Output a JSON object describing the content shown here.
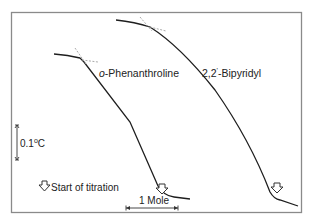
{
  "figure": {
    "type": "thermometric-titration-curves",
    "colors": {
      "frame": "#7a7a7a",
      "curve": "#1e1e1e",
      "tangent": "#9a9a9a",
      "text": "#222222",
      "background": "#ffffff"
    }
  },
  "curves": [
    {
      "name": "o-Phenanthroline",
      "label": "o-Phenanthroline",
      "label_prefix": "o",
      "label_suffix": "-Phenanthroline"
    },
    {
      "name": "2,2'-Bipyridyl",
      "label": "2,2'-Bipyridyl",
      "label_main": "2,2",
      "label_prime": "'",
      "label_rest": "-Bipyridyl"
    }
  ],
  "scale_bar_temperature": {
    "label": "0.1",
    "degree": "o",
    "unit": "C"
  },
  "scale_bar_amount": {
    "label": "1 Mole"
  },
  "legend": {
    "icon": "hollow-down-arrow-icon",
    "label": "Start of titration"
  }
}
